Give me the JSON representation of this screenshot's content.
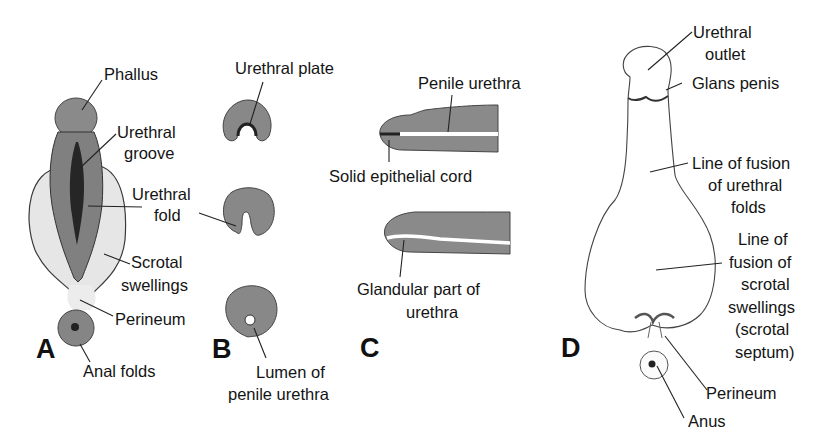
{
  "figure": {
    "colors": {
      "tissue_dark": "#7f7f7f",
      "tissue_mid": "#8c8c8c",
      "groove_dark": "#2b2b2b",
      "swelling_light": "#e6e6e6",
      "outline": "#3a3a3a",
      "text": "#141414"
    },
    "panels": [
      {
        "letter": "A",
        "labels": {
          "phallus": "Phallus",
          "urethral_groove_1": "Urethral",
          "urethral_groove_2": "groove",
          "urethral_fold_1": "Urethral",
          "urethral_fold_2": "fold",
          "scrotal_swellings_1": "Scrotal",
          "scrotal_swellings_2": "swellings",
          "perineum": "Perineum",
          "anal_folds": "Anal folds"
        }
      },
      {
        "letter": "B",
        "labels": {
          "urethral_plate": "Urethral plate",
          "lumen_1": "Lumen of",
          "lumen_2": "penile urethra"
        }
      },
      {
        "letter": "C",
        "labels": {
          "penile_urethra": "Penile urethra",
          "solid_epithelial_cord": "Solid epithelial cord",
          "glandular_1": "Glandular part of",
          "glandular_2": "urethra"
        }
      },
      {
        "letter": "D",
        "labels": {
          "urethral_outlet_1": "Urethral",
          "urethral_outlet_2": "outlet",
          "glans_penis": "Glans penis",
          "fusion_urethral_1": "Line of fusion",
          "fusion_urethral_2": "of urethral",
          "fusion_urethral_3": "folds",
          "fusion_scrotal_1": "Line of",
          "fusion_scrotal_2": "fusion of",
          "fusion_scrotal_3": "scrotal",
          "fusion_scrotal_4": "swellings",
          "fusion_scrotal_5": "(scrotal",
          "fusion_scrotal_6": "septum)",
          "perineum": "Perineum",
          "anus": "Anus"
        }
      }
    ]
  }
}
